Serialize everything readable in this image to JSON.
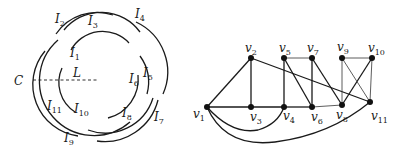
{
  "left_figure": {
    "description": "Circular arc intervals around a circle with cut line C",
    "cut_label": "C",
    "line_label": "L",
    "intervals": [
      {
        "name": "I",
        "sub": "1"
      },
      {
        "name": "I",
        "sub": "2"
      },
      {
        "name": "I",
        "sub": "3"
      },
      {
        "name": "I",
        "sub": "4"
      },
      {
        "name": "I",
        "sub": "5"
      },
      {
        "name": "I",
        "sub": "6"
      },
      {
        "name": "I",
        "sub": "7"
      },
      {
        "name": "I",
        "sub": "8"
      },
      {
        "name": "I",
        "sub": "9"
      },
      {
        "name": "I",
        "sub": "10"
      },
      {
        "name": "I",
        "sub": "11"
      }
    ]
  },
  "right_figure": {
    "description": "Graph with vertices v1..v11",
    "vertices": [
      {
        "name": "v",
        "sub": "1"
      },
      {
        "name": "v",
        "sub": "2"
      },
      {
        "name": "v",
        "sub": "3"
      },
      {
        "name": "v",
        "sub": "4"
      },
      {
        "name": "v",
        "sub": "5"
      },
      {
        "name": "v",
        "sub": "6"
      },
      {
        "name": "v",
        "sub": "7"
      },
      {
        "name": "v",
        "sub": "8"
      },
      {
        "name": "v",
        "sub": "9"
      },
      {
        "name": "v",
        "sub": "10"
      },
      {
        "name": "v",
        "sub": "11"
      }
    ],
    "edges": [
      [
        "v1",
        "v2"
      ],
      [
        "v1",
        "v3"
      ],
      [
        "v2",
        "v3"
      ],
      [
        "v3",
        "v4"
      ],
      [
        "v4",
        "v6"
      ],
      [
        "v6",
        "v8"
      ],
      [
        "v4",
        "v5"
      ],
      [
        "v5",
        "v7"
      ],
      [
        "v7",
        "v6"
      ],
      [
        "v5",
        "v6"
      ],
      [
        "v7",
        "v8"
      ],
      [
        "v2",
        "v11"
      ],
      [
        "v9",
        "v10"
      ],
      [
        "v9",
        "v8"
      ],
      [
        "v10",
        "v11"
      ],
      [
        "v10",
        "v8"
      ],
      [
        "v9",
        "v11"
      ],
      [
        "v1",
        "v4"
      ],
      [
        "v1",
        "v11"
      ]
    ]
  }
}
